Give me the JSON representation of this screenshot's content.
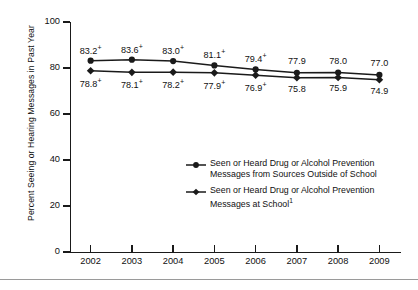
{
  "chart_data": {
    "type": "line",
    "title": "",
    "subtitle": "",
    "xlabel": "",
    "ylabel": "Percent Seeing or Hearing Messages in Past Year",
    "categories": [
      "2002",
      "2003",
      "2004",
      "2005",
      "2006",
      "2007",
      "2008",
      "2009"
    ],
    "xtick_labels": [
      "2002",
      "2003",
      "2004",
      "2005",
      "2006",
      "2007",
      "2008",
      "2009"
    ],
    "ytick_labels": [
      "0",
      "20",
      "40",
      "60",
      "80",
      "100"
    ],
    "ytick_values": [
      0,
      20,
      40,
      60,
      80,
      100
    ],
    "ylim": [
      0,
      100
    ],
    "grid": false,
    "legend_position": "inside-center-right",
    "series": [
      {
        "name": "Seen or Heard Drug or Alcohol Prevention Messages from Sources Outside of School",
        "legend_line1": "Seen or Heard Drug or Alcohol Prevention",
        "legend_line2": "Messages from Sources Outside of School",
        "legend_footnote": "",
        "marker": "circle",
        "color": "#1a1a1a",
        "label_side": "above",
        "values": [
          83.2,
          83.6,
          83.0,
          81.1,
          79.4,
          77.9,
          78.0,
          77.0
        ],
        "point_labels": [
          {
            "text": "83.2",
            "sig": "+"
          },
          {
            "text": "83.6",
            "sig": "+"
          },
          {
            "text": "83.0",
            "sig": "+"
          },
          {
            "text": "81.1",
            "sig": "+"
          },
          {
            "text": "79.4",
            "sig": "+"
          },
          {
            "text": "77.9",
            "sig": ""
          },
          {
            "text": "78.0",
            "sig": ""
          },
          {
            "text": "77.0",
            "sig": ""
          }
        ]
      },
      {
        "name": "Seen or Heard Drug or Alcohol Prevention Messages at School",
        "legend_line1": "Seen or Heard Drug or Alcohol Prevention",
        "legend_line2": "Messages at School",
        "legend_footnote": "1",
        "marker": "diamond",
        "color": "#1a1a1a",
        "label_side": "below",
        "values": [
          78.8,
          78.1,
          78.2,
          77.9,
          76.9,
          75.8,
          75.9,
          74.9
        ],
        "point_labels": [
          {
            "text": "78.8",
            "sig": "+"
          },
          {
            "text": "78.1",
            "sig": "+"
          },
          {
            "text": "78.2",
            "sig": "+"
          },
          {
            "text": "77.9",
            "sig": "+"
          },
          {
            "text": "76.9",
            "sig": "+"
          },
          {
            "text": "75.8",
            "sig": ""
          },
          {
            "text": "75.9",
            "sig": ""
          },
          {
            "text": "74.9",
            "sig": ""
          }
        ]
      }
    ]
  }
}
